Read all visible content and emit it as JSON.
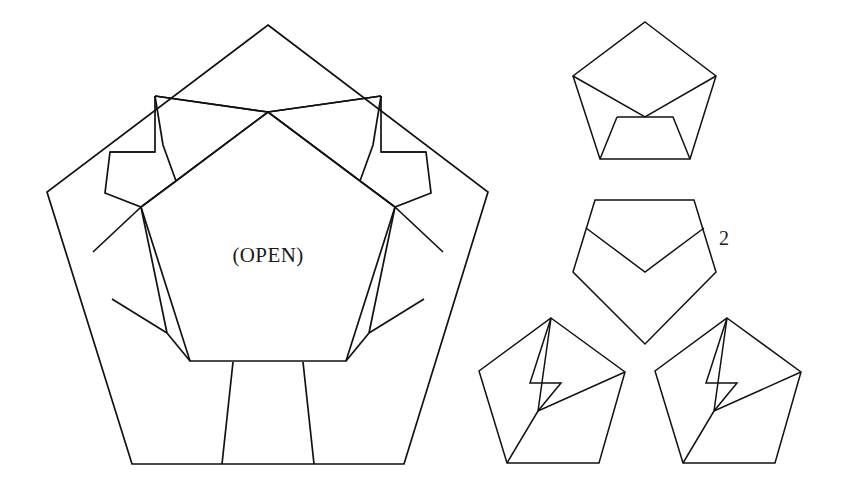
{
  "figure": {
    "background_color": "#ffffff",
    "stroke_color": "#111111",
    "width": 842,
    "height": 492
  },
  "labels": {
    "open_label": "(OPEN)",
    "step_number": "2"
  },
  "main_figure": {
    "name": "large-pentagon-with-folded-flaps",
    "outer_pentagon_points": "268,25 488,192 404,464 132,464 47,192",
    "inner_pentagon_points": "268,92 410,199 355,369 180,369 126,199",
    "center_open_region_points": "268,112 394,208 344,362 192,362 142,208"
  },
  "small_figures": [
    {
      "name": "small-pentagon-top",
      "outer_points": "645,22 715,75 690,158 600,158 573,75"
    },
    {
      "name": "small-pentagon-middle-step2",
      "outer_points": "644,199 695,199 716,272 644,343 573,272 594,199"
    },
    {
      "name": "small-pentagon-bottom-left",
      "outer_points": "562,318 626,371 600,463 508,463 481,371"
    },
    {
      "name": "small-pentagon-bottom-right",
      "outer_points": "727,318 791,371 765,463 673,463 646,371"
    }
  ]
}
